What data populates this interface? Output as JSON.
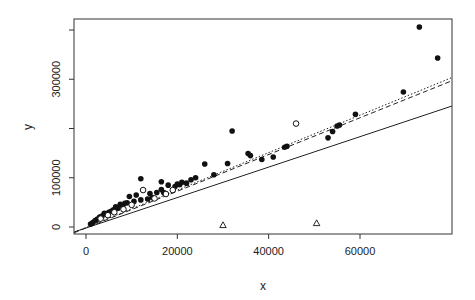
{
  "chart_data": {
    "type": "scatter",
    "title": "",
    "xlabel": "x",
    "ylabel": "y",
    "xlim": [
      -2600,
      80200
    ],
    "ylim": [
      -16000,
      420000
    ],
    "grid": false,
    "legend": null,
    "x_ticks": [
      0,
      20000,
      40000,
      60000
    ],
    "x_tick_labels": [
      "0",
      "20000",
      "40000",
      "60000"
    ],
    "y_ticks": [
      0,
      100000,
      200000,
      300000,
      400000
    ],
    "y_tick_labels": [
      "0",
      "100000",
      "",
      "300000",
      ""
    ],
    "series": [
      {
        "name": "filled-circles",
        "marker": "filled-circle",
        "points": [
          [
            73000,
            406000
          ],
          [
            77000,
            343000
          ],
          [
            69500,
            274000
          ],
          [
            59000,
            229000
          ],
          [
            55500,
            207000
          ],
          [
            55000,
            205000
          ],
          [
            54000,
            194000
          ],
          [
            53000,
            181000
          ],
          [
            44000,
            164000
          ],
          [
            43500,
            162000
          ],
          [
            41000,
            142000
          ],
          [
            38500,
            137000
          ],
          [
            36000,
            145000
          ],
          [
            35500,
            149000
          ],
          [
            32000,
            195000
          ],
          [
            31000,
            129000
          ],
          [
            28000,
            106000
          ],
          [
            26000,
            128000
          ],
          [
            24000,
            100000
          ],
          [
            23000,
            96000
          ],
          [
            22000,
            89000
          ],
          [
            21000,
            91000
          ],
          [
            20500,
            86000
          ],
          [
            20000,
            87000
          ],
          [
            19500,
            82000
          ],
          [
            18000,
            85000
          ],
          [
            16500,
            92000
          ],
          [
            16500,
            76000
          ],
          [
            15500,
            70000
          ],
          [
            14000,
            68000
          ],
          [
            12000,
            98000
          ],
          [
            12000,
            55000
          ],
          [
            11000,
            65000
          ],
          [
            10500,
            52000
          ],
          [
            9500,
            62000
          ],
          [
            9000,
            49000
          ],
          [
            8500,
            48000
          ],
          [
            8000,
            43000
          ],
          [
            7500,
            46000
          ],
          [
            7000,
            38000
          ],
          [
            6500,
            41000
          ],
          [
            6000,
            35000
          ],
          [
            5500,
            32000
          ],
          [
            5000,
            30000
          ],
          [
            4500,
            27000
          ],
          [
            4000,
            28000
          ],
          [
            3500,
            22000
          ],
          [
            3000,
            20000
          ],
          [
            2500,
            16000
          ],
          [
            2000,
            13000
          ],
          [
            1500,
            9000
          ],
          [
            1000,
            6000
          ],
          [
            13500,
            57000
          ],
          [
            14500,
            60000
          ],
          [
            17000,
            70000
          ]
        ]
      },
      {
        "name": "open-circles",
        "marker": "open-circle",
        "points": [
          [
            46000,
            210000
          ],
          [
            12500,
            75000
          ],
          [
            10000,
            45000
          ],
          [
            8200,
            36000
          ],
          [
            6200,
            30000
          ],
          [
            4800,
            24000
          ],
          [
            3200,
            17000
          ],
          [
            15000,
            58000
          ],
          [
            17500,
            67000
          ],
          [
            19000,
            75000
          ]
        ]
      },
      {
        "name": "triangles",
        "marker": "open-triangle",
        "points": [
          [
            30000,
            4000
          ],
          [
            50500,
            8000
          ]
        ]
      }
    ],
    "lines": [
      {
        "name": "solid-fit",
        "style": "solid",
        "slope": 3.09,
        "intercept": -2000
      },
      {
        "name": "dashed-fit",
        "style": "dashed",
        "slope": 3.73,
        "intercept": -2000
      },
      {
        "name": "dotted-fit",
        "style": "dotted",
        "slope": 3.8,
        "intercept": -1000
      }
    ]
  },
  "axes": {
    "xlabel": "x",
    "ylabel": "y"
  }
}
